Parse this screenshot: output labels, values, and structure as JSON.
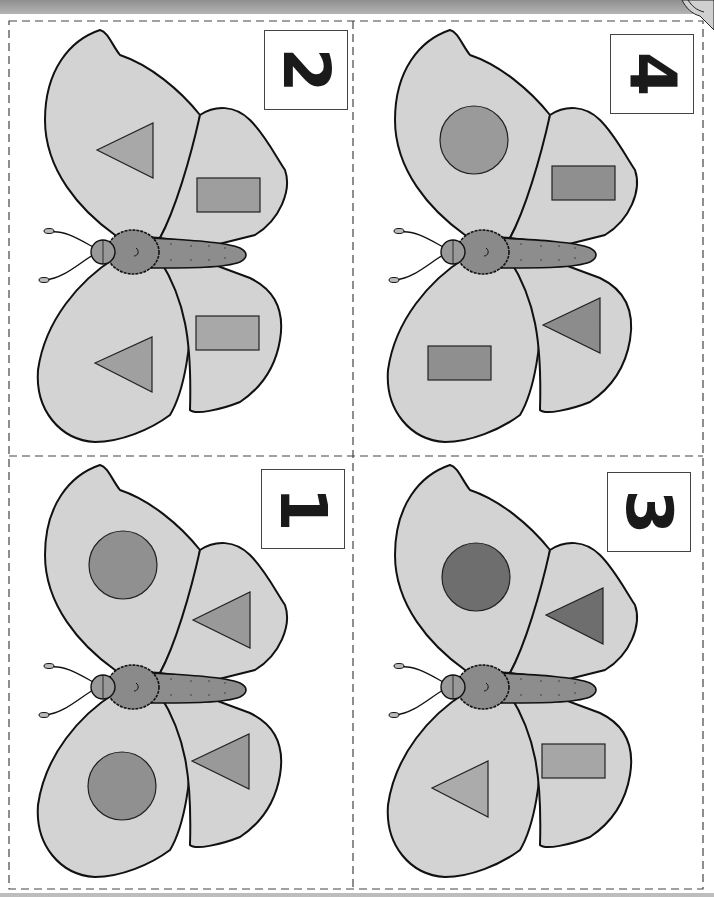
{
  "worksheet": {
    "title": "Butterfly shape matching cards",
    "colors": {
      "wing": "#d3d3d3",
      "outline": "#111111",
      "body": "#8a8a8a",
      "shape_medium": "#9a9a9a",
      "shape_dark": "#6e6e6e",
      "shape_light": "#a8a8a8",
      "dash": "#444444"
    },
    "cards": [
      {
        "position": "top-left",
        "number": "2",
        "shapes": {
          "upper_fore": "triangle",
          "upper_hind": "rectangle",
          "lower_fore": "triangle",
          "lower_hind": "rectangle"
        }
      },
      {
        "position": "top-right",
        "number": "4",
        "shapes": {
          "upper_fore": "circle",
          "upper_hind": "rectangle",
          "lower_fore": "rectangle",
          "lower_hind": "triangle"
        }
      },
      {
        "position": "bottom-left",
        "number": "1",
        "shapes": {
          "upper_fore": "circle",
          "upper_hind": "triangle",
          "lower_fore": "circle",
          "lower_hind": "triangle"
        }
      },
      {
        "position": "bottom-right",
        "number": "3",
        "shapes": {
          "upper_fore": "circle",
          "upper_hind": "triangle",
          "lower_fore": "triangle",
          "lower_hind": "rectangle"
        }
      }
    ]
  }
}
